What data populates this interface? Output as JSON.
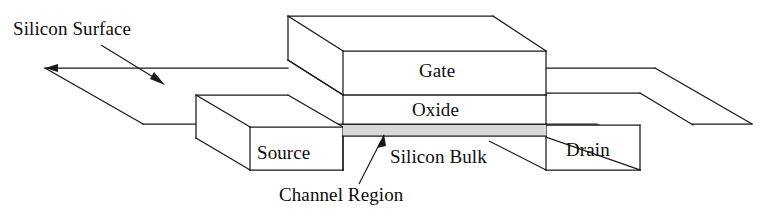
{
  "figure": {
    "background_color": "#ffffff",
    "line_color": "#1a1a1a",
    "channel_fill_color": "#d8d8d8"
  },
  "labels": {
    "silicon_surface": "Silicon Surface",
    "gate": "Gate",
    "oxide": "Oxide",
    "source": "Source",
    "silicon_bulk": "Silicon Bulk",
    "drain": "Drain",
    "channel_region": "Channel Region"
  },
  "annotations": [
    {
      "name": "silicon-surface-callout",
      "text": "Silicon Surface",
      "arrow_from": [
        101,
        45
      ],
      "arrow_to": [
        163,
        84
      ]
    },
    {
      "name": "channel-region-callout",
      "text": "Channel Region",
      "arrow_from": [
        359,
        184
      ],
      "arrow_to": [
        384,
        136
      ]
    }
  ],
  "regions": [
    {
      "name": "silicon-surface-plane",
      "label": ""
    },
    {
      "name": "gate-block",
      "label": "Gate"
    },
    {
      "name": "oxide-layer",
      "label": "Oxide"
    },
    {
      "name": "channel-region-band",
      "label": ""
    },
    {
      "name": "source-block",
      "label": "Source"
    },
    {
      "name": "drain-block",
      "label": "Drain"
    },
    {
      "name": "silicon-bulk-body",
      "label": "Silicon Bulk"
    }
  ]
}
